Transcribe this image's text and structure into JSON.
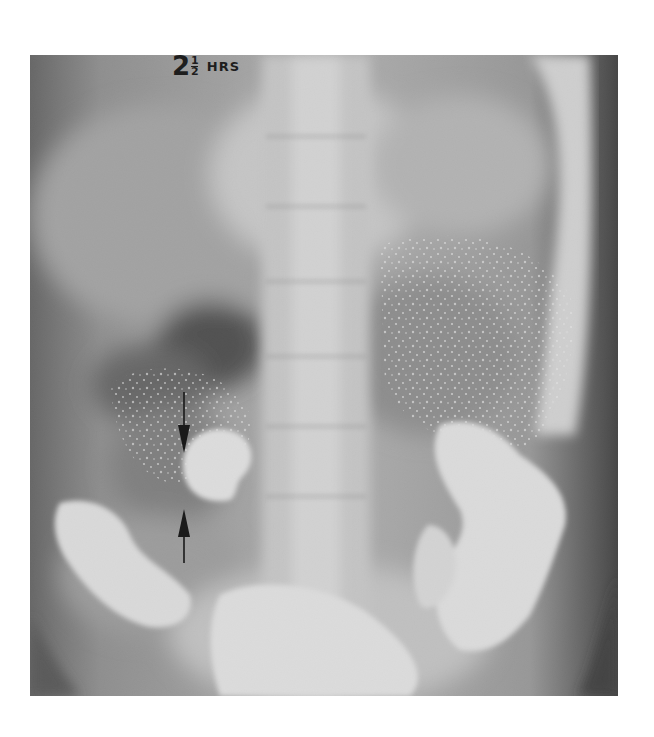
{
  "image": {
    "type": "radiograph",
    "label": {
      "whole": "2",
      "numerator": "1",
      "denominator": "2",
      "unit": "HRS"
    },
    "annotations": [
      {
        "name": "arrow-down",
        "direction": "down"
      },
      {
        "name": "arrow-up",
        "direction": "up"
      }
    ],
    "colors": {
      "background": "#ffffff",
      "film_dark": "#3a3a3a",
      "film_mid": "#8a8a8a",
      "film_bright": "#f2f2f2",
      "arrow": "#1a1a1a"
    }
  }
}
